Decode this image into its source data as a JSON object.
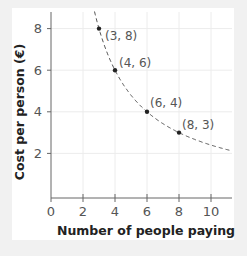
{
  "chart_data": {
    "type": "line",
    "title": "",
    "xlabel": "Number of people paying",
    "ylabel": "Cost per person (€)",
    "xlim": [
      0,
      11.3
    ],
    "ylim": [
      0,
      8.8
    ],
    "x_ticks": [
      "0",
      "2",
      "4",
      "6",
      "8",
      "10"
    ],
    "y_ticks": [
      "2",
      "4",
      "6",
      "8"
    ],
    "grid": true,
    "series": [
      {
        "name": "y = 24/x",
        "style": "dashed",
        "function": "24/x",
        "points": [
          {
            "x": 3,
            "y": 8,
            "label": "(3, 8)"
          },
          {
            "x": 4,
            "y": 6,
            "label": "(4, 6)"
          },
          {
            "x": 6,
            "y": 4,
            "label": "(6, 4)"
          },
          {
            "x": 8,
            "y": 3,
            "label": "(8, 3)"
          }
        ]
      }
    ]
  },
  "axes": {
    "x_title": "Number of people paying",
    "y_title": "Cost per person (€)",
    "x_tick_labels": [
      "0",
      "2",
      "4",
      "6",
      "8",
      "10"
    ],
    "y_tick_labels": [
      "2",
      "4",
      "6",
      "8"
    ]
  },
  "points": [
    {
      "label": "(3, 8)"
    },
    {
      "label": "(4, 6)"
    },
    {
      "label": "(6, 4)"
    },
    {
      "label": "(8, 3)"
    }
  ]
}
